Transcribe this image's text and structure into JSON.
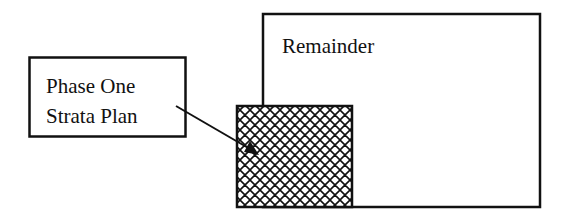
{
  "diagram": {
    "remainder": {
      "label": "Remainder",
      "box": {
        "x": 262,
        "y": 13,
        "width": 278,
        "height": 194
      },
      "fill": "#ffffff",
      "stroke": "#111111"
    },
    "phase_one": {
      "label_lines": [
        "Phase One",
        "Strata Plan"
      ],
      "label_box": {
        "x": 29,
        "y": 57,
        "width": 157,
        "height": 80
      },
      "hatched_area": {
        "x": 236,
        "y": 105,
        "width": 116,
        "height": 102
      },
      "hatch_pattern": "diagonal-crosshatch",
      "hatch_color": "#111111"
    },
    "arrow": {
      "from": {
        "x": 176,
        "y": 106
      },
      "to": {
        "x": 258,
        "y": 154
      },
      "color": "#111111"
    }
  }
}
